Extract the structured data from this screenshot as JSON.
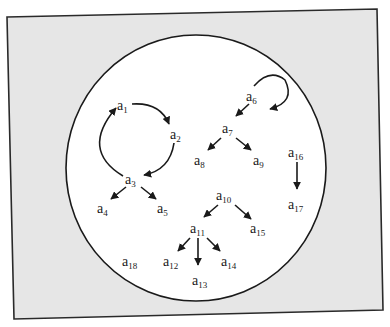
{
  "diagram": {
    "colors": {
      "page_background": "#ffffff",
      "frame_fill": "#e6e6e6",
      "frame_stroke": "#2a2a2a",
      "circle_fill": "#ffffff",
      "circle_stroke": "#1a1a1a",
      "edge_color": "#1a1a1a"
    },
    "nodes": [
      {
        "id": "a1",
        "base": "a",
        "sub": "1"
      },
      {
        "id": "a2",
        "base": "a",
        "sub": "2"
      },
      {
        "id": "a3",
        "base": "a",
        "sub": "3"
      },
      {
        "id": "a4",
        "base": "a",
        "sub": "4"
      },
      {
        "id": "a5",
        "base": "a",
        "sub": "5"
      },
      {
        "id": "a6",
        "base": "a",
        "sub": "6"
      },
      {
        "id": "a7",
        "base": "a",
        "sub": "7"
      },
      {
        "id": "a8",
        "base": "a",
        "sub": "8"
      },
      {
        "id": "a9",
        "base": "a",
        "sub": "9"
      },
      {
        "id": "a10",
        "base": "a",
        "sub": "10"
      },
      {
        "id": "a11",
        "base": "a",
        "sub": "11"
      },
      {
        "id": "a12",
        "base": "a",
        "sub": "12"
      },
      {
        "id": "a13",
        "base": "a",
        "sub": "13"
      },
      {
        "id": "a14",
        "base": "a",
        "sub": "14"
      },
      {
        "id": "a15",
        "base": "a",
        "sub": "15"
      },
      {
        "id": "a16",
        "base": "a",
        "sub": "16"
      },
      {
        "id": "a17",
        "base": "a",
        "sub": "17"
      },
      {
        "id": "a18",
        "base": "a",
        "sub": "18"
      }
    ],
    "edges": [
      {
        "from": "a1",
        "to": "a2",
        "style": "curved"
      },
      {
        "from": "a2",
        "to": "a3",
        "style": "curved"
      },
      {
        "from": "a3",
        "to": "a1",
        "style": "curved"
      },
      {
        "from": "a3",
        "to": "a4",
        "style": "straight"
      },
      {
        "from": "a3",
        "to": "a5",
        "style": "straight"
      },
      {
        "from": "a6",
        "to": "a6",
        "style": "self-loop"
      },
      {
        "from": "a6",
        "to": "a7",
        "style": "straight"
      },
      {
        "from": "a7",
        "to": "a8",
        "style": "straight"
      },
      {
        "from": "a7",
        "to": "a9",
        "style": "straight"
      },
      {
        "from": "a10",
        "to": "a11",
        "style": "straight"
      },
      {
        "from": "a10",
        "to": "a15",
        "style": "straight"
      },
      {
        "from": "a11",
        "to": "a12",
        "style": "straight"
      },
      {
        "from": "a11",
        "to": "a13",
        "style": "straight"
      },
      {
        "from": "a11",
        "to": "a14",
        "style": "straight"
      },
      {
        "from": "a16",
        "to": "a17",
        "style": "straight"
      }
    ],
    "isolated_nodes": [
      "a18"
    ]
  }
}
